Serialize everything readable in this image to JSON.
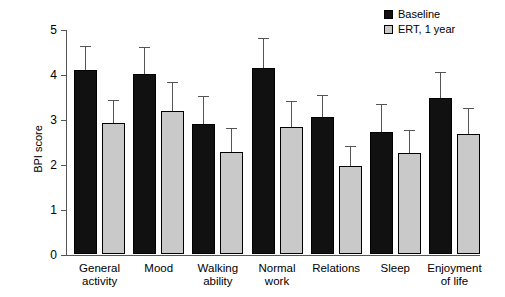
{
  "chart_data": {
    "type": "bar",
    "title": "",
    "xlabel": "",
    "ylabel": "BPI score",
    "ylim": [
      0,
      5
    ],
    "yticks": [
      "0",
      "1",
      "2",
      "3",
      "4",
      "5"
    ],
    "grid": false,
    "legend_position": "top-right",
    "categories": [
      "General activity",
      "Mood",
      "Walking ability",
      "Normal work",
      "Relations",
      "Sleep",
      "Enjoyment of life"
    ],
    "category_lines": [
      [
        "General",
        "activity"
      ],
      [
        "Mood",
        ""
      ],
      [
        "Walking",
        "ability"
      ],
      [
        "Normal",
        "work"
      ],
      [
        "Relations",
        ""
      ],
      [
        "Sleep",
        ""
      ],
      [
        "Enjoyment",
        "of life"
      ]
    ],
    "series": [
      {
        "name": "Baseline",
        "color": "#111111",
        "values": [
          4.1,
          4.0,
          2.9,
          4.13,
          3.05,
          2.72,
          3.46
        ],
        "errors_upper": [
          4.6,
          4.58,
          3.48,
          4.77,
          3.52,
          3.32,
          4.02
        ]
      },
      {
        "name": "ERT, 1 year",
        "color": "#c9c9c9",
        "values": [
          2.92,
          3.18,
          2.27,
          2.82,
          1.95,
          2.25,
          2.67
        ],
        "errors_upper": [
          3.4,
          3.79,
          2.78,
          3.37,
          2.38,
          2.73,
          3.22
        ]
      }
    ]
  },
  "legend": {
    "items": [
      {
        "label": "Baseline",
        "swatch": "baseline"
      },
      {
        "label": "ERT, 1 year",
        "swatch": "ert"
      }
    ]
  }
}
